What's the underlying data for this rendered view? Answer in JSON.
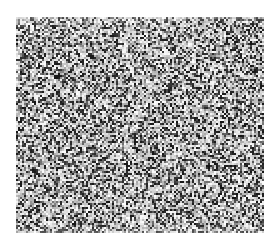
{
  "canvas": {
    "width": 280,
    "height": 244,
    "background": "#ffffff"
  },
  "noise_field": {
    "x": 16,
    "y": 17,
    "width": 248,
    "height": 216,
    "description": "grayscale random speckle noise texture",
    "dark_color": "#1a1a1a",
    "light_color": "#f2f2f2",
    "grain_px": 2,
    "dark_density": 0.42,
    "seed": 1337
  }
}
